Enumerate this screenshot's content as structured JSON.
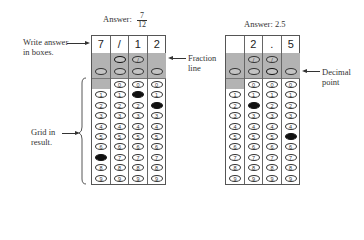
{
  "left_example": {
    "answer_label": "Answer:",
    "fraction_numerator": "7",
    "fraction_denominator": "12",
    "boxes": [
      "7",
      "/",
      "1",
      "2"
    ],
    "filled": [
      {
        "column": 0,
        "row": "7"
      },
      {
        "column": 1,
        "row": "/"
      },
      {
        "column": 2,
        "row": "1"
      },
      {
        "column": 3,
        "row": "2"
      }
    ]
  },
  "right_example": {
    "answer_label": "Answer: 2.5",
    "boxes": [
      "",
      "2",
      ".",
      "5"
    ],
    "filled": [
      {
        "column": 1,
        "row": "2"
      },
      {
        "column": 2,
        "row": "."
      },
      {
        "column": 3,
        "row": "5"
      }
    ]
  },
  "annotations": {
    "write_answer": [
      "Write answer",
      "in boxes."
    ],
    "fraction_line": [
      "Fraction",
      "line"
    ],
    "grid_in": [
      "Grid in",
      "result."
    ],
    "decimal_point": [
      "Decimal",
      "point"
    ]
  },
  "bubble_digits": [
    "0",
    "1",
    "2",
    "3",
    "4",
    "5",
    "6",
    "7",
    "8",
    "9"
  ],
  "slash_symbol": "/",
  "dot_symbol": "."
}
